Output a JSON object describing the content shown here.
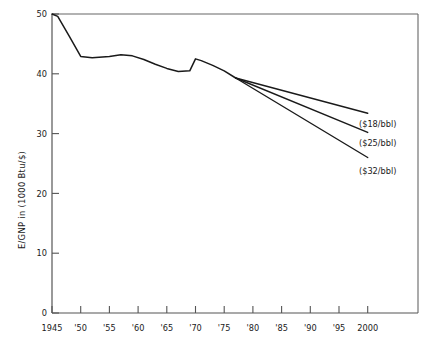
{
  "chart_data": {
    "type": "line",
    "title": "",
    "xlabel": "",
    "ylabel": "E/GNP in (1000 Btu/$)",
    "xlim": [
      1945,
      2003
    ],
    "ylim": [
      0,
      50
    ],
    "grid": false,
    "legend_position": "inline-right-annotations",
    "x_tick_labels": [
      "1945",
      "'50",
      "'55",
      "'60",
      "'65",
      "'70",
      "'75",
      "'80",
      "'85",
      "'90",
      "'95",
      "2000"
    ],
    "x_tick_values": [
      1945,
      1950,
      1955,
      1960,
      1965,
      1970,
      1975,
      1980,
      1985,
      1990,
      1995,
      2000
    ],
    "y_tick_labels": [
      "0",
      "10",
      "20",
      "30",
      "40",
      "50"
    ],
    "y_tick_values": [
      0,
      10,
      20,
      30,
      40,
      50
    ],
    "series": [
      {
        "name": "Historical",
        "kind": "historical",
        "x": [
          1945,
          1946,
          1948,
          1950,
          1952,
          1955,
          1957,
          1959,
          1961,
          1963,
          1965,
          1967,
          1969,
          1970,
          1971,
          1973,
          1975,
          1977
        ],
        "values": [
          50.0,
          49.6,
          46.3,
          42.9,
          42.7,
          42.9,
          43.2,
          43.0,
          42.4,
          41.6,
          40.9,
          40.4,
          40.5,
          42.5,
          42.2,
          41.4,
          40.5,
          39.3
        ]
      },
      {
        "name": "($18/bbl)",
        "kind": "projection",
        "x": [
          1977,
          2000
        ],
        "values": [
          39.3,
          33.4
        ]
      },
      {
        "name": "($25/bbl)",
        "kind": "projection",
        "x": [
          1977,
          2000
        ],
        "values": [
          39.3,
          30.2
        ]
      },
      {
        "name": "($32/bbl)",
        "kind": "projection",
        "x": [
          1977,
          2000
        ],
        "values": [
          39.3,
          26.0
        ]
      }
    ],
    "annotations": [
      {
        "text": "($18/bbl)",
        "x": 2000,
        "y": 33.4
      },
      {
        "text": "($25/bbl)",
        "x": 2000,
        "y": 30.2
      },
      {
        "text": "($32/bbl)",
        "x": 2000,
        "y": 26.0
      }
    ],
    "colors": {
      "line": "#1a1a1a",
      "axis": "#555555",
      "background": "#ffffff",
      "text": "#1a1a1a"
    }
  }
}
